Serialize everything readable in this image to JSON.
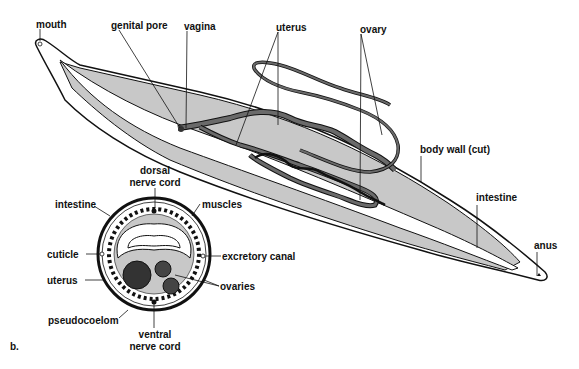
{
  "figure": {
    "panel_label": "b.",
    "longitudinal_view": {
      "labels": {
        "mouth": "mouth",
        "genital_pore": "genital pore",
        "vagina": "vagina",
        "uterus": "uterus",
        "ovary": "ovary",
        "body_wall": "body wall (cut)",
        "intestine": "intestine",
        "anus": "anus"
      }
    },
    "cross_section": {
      "labels": {
        "dorsal_nerve_cord_1": "dorsal",
        "dorsal_nerve_cord_2": "nerve cord",
        "intestine": "intestine",
        "muscles": "muscles",
        "cuticle": "cuticle",
        "excretory_canal": "excretory canal",
        "uterus": "uterus",
        "ovaries": "ovaries",
        "pseudocoelom": "pseudocoelom",
        "ventral_nerve_cord_1": "ventral",
        "ventral_nerve_cord_2": "nerve cord"
      }
    },
    "colors": {
      "body_fill": "#c8c8c8",
      "organ_fill": "#6a6a6a",
      "outline": "#111111",
      "background": "#ffffff"
    }
  }
}
